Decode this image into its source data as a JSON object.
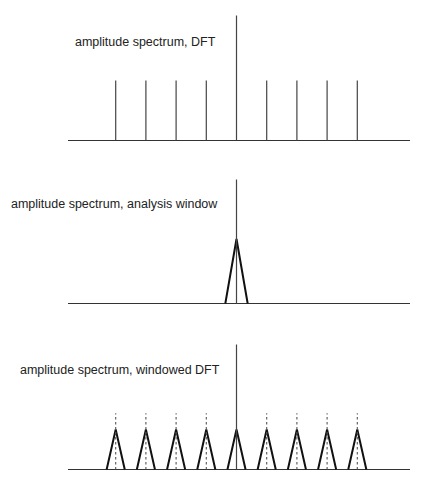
{
  "panels": [
    {
      "id": "dft",
      "title": "amplitude spectrum, DFT",
      "kind": "stems",
      "bins": [
        -4,
        -3,
        -2,
        -1,
        0,
        1,
        2,
        3,
        4
      ],
      "amplitudes": [
        0.48,
        0.48,
        0.48,
        0.48,
        1.0,
        0.48,
        0.48,
        0.48,
        0.48
      ]
    },
    {
      "id": "window",
      "title": "amplitude spectrum, analysis window",
      "kind": "window",
      "center_bin": 0,
      "center_amplitude": 1.0,
      "window_peak": 0.52,
      "window_halfwidth_bins": 0.37
    },
    {
      "id": "windowed",
      "title": "amplitude spectrum, windowed DFT",
      "kind": "windowed",
      "bins": [
        -4,
        -3,
        -2,
        -1,
        0,
        1,
        2,
        3,
        4
      ],
      "amplitudes": [
        0.45,
        0.45,
        0.45,
        0.45,
        1.0,
        0.45,
        0.45,
        0.45,
        0.45
      ],
      "window_peak": 0.32,
      "window_halfwidth_bins": 0.3
    }
  ],
  "chart_data": [
    {
      "type": "bar",
      "title": "amplitude spectrum, DFT",
      "x": [
        -4,
        -3,
        -2,
        -1,
        0,
        1,
        2,
        3,
        4
      ],
      "values": [
        0.48,
        0.48,
        0.48,
        0.48,
        1.0,
        0.48,
        0.48,
        0.48,
        0.48
      ],
      "xlabel": "",
      "ylabel": "",
      "grid": false
    },
    {
      "type": "line",
      "title": "amplitude spectrum, analysis window",
      "series": [
        {
          "name": "impulse",
          "x": [
            0
          ],
          "values": [
            1.0
          ]
        },
        {
          "name": "window",
          "x": [
            -0.37,
            0,
            0.37
          ],
          "values": [
            0,
            0.52,
            0
          ]
        }
      ],
      "xlabel": "",
      "ylabel": "",
      "grid": false
    },
    {
      "type": "line",
      "title": "amplitude spectrum, windowed DFT",
      "series": [
        {
          "name": "impulses",
          "x": [
            -4,
            -3,
            -2,
            -1,
            0,
            1,
            2,
            3,
            4
          ],
          "values": [
            0.45,
            0.45,
            0.45,
            0.45,
            1.0,
            0.45,
            0.45,
            0.45,
            0.45
          ]
        },
        {
          "name": "windowed peaks",
          "x": [
            -4,
            -3,
            -2,
            -1,
            0,
            1,
            2,
            3,
            4
          ],
          "values": [
            0.32,
            0.32,
            0.32,
            0.32,
            0.32,
            0.32,
            0.32,
            0.32,
            0.32
          ]
        }
      ],
      "xlabel": "",
      "ylabel": "",
      "grid": false
    }
  ]
}
